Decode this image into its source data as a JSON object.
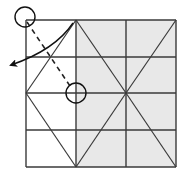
{
  "diagram": {
    "type": "origami-fold-instruction",
    "grid": {
      "columns_x": [
        26,
        76,
        126,
        176
      ],
      "rows_y": [
        20,
        57,
        93,
        130,
        167
      ],
      "shaded_region": {
        "x1": 76,
        "x2": 176,
        "color": "#e8e8e8"
      },
      "line_color": "#3a3a3a"
    },
    "crease_lines": [
      {
        "x1": 76,
        "y1": 20,
        "x2": 26,
        "y2": 93
      },
      {
        "x1": 26,
        "y1": 93,
        "x2": 76,
        "y2": 167
      },
      {
        "x1": 76,
        "y1": 20,
        "x2": 126,
        "y2": 93
      },
      {
        "x1": 126,
        "y1": 93,
        "x2": 76,
        "y2": 167
      },
      {
        "x1": 176,
        "y1": 20,
        "x2": 126,
        "y2": 93
      },
      {
        "x1": 126,
        "y1": 93,
        "x2": 176,
        "y2": 167
      }
    ],
    "markers": {
      "corner_circle": {
        "cx": 25,
        "cy": 17,
        "r": 10
      },
      "target_circle": {
        "cx": 76,
        "cy": 93,
        "r": 10
      }
    },
    "dashed_fold_line": {
      "x1": 27,
      "y1": 22,
      "x2": 70,
      "y2": 86
    },
    "fold_arrow": {
      "path": "M 73 23 Q 55 50 11 65",
      "head": [
        6,
        67
      ]
    }
  }
}
